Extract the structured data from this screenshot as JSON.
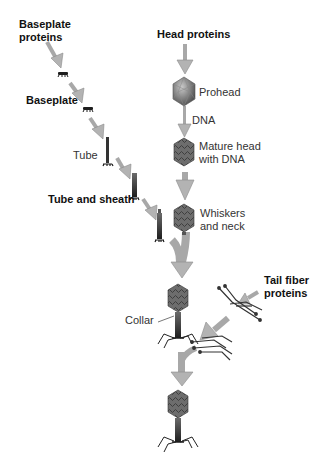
{
  "diagram": {
    "labels": {
      "baseplate_proteins_1": "Baseplate",
      "baseplate_proteins_2": "proteins",
      "head_proteins": "Head proteins",
      "prohead": "Prohead",
      "dna": "DNA",
      "baseplate": "Baseplate",
      "mature_head_1": "Mature head",
      "mature_head_2": "with DNA",
      "tube": "Tube",
      "tube_and_sheath": "Tube and sheath",
      "whiskers_1": "Whiskers",
      "whiskers_2": "and neck",
      "tail_fiber_1": "Tail fiber",
      "tail_fiber_2": "proteins",
      "collar": "Collar"
    },
    "colors": {
      "arrow": "#b3b3b3",
      "arrow_stroke": "#8c8c8c",
      "head": "#7a7a7a",
      "tail": "#2b2b2b"
    }
  }
}
